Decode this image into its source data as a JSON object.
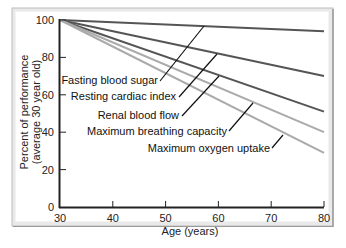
{
  "chart_data": {
    "type": "line",
    "title": "",
    "xlabel": "Age (years)",
    "ylabel": [
      "Percent of performance",
      "(average 30 year old)"
    ],
    "xlim": [
      30,
      80
    ],
    "ylim": [
      0,
      100
    ],
    "xticks": [
      30,
      40,
      50,
      60,
      70,
      80
    ],
    "yticks": [
      0,
      20,
      40,
      60,
      80,
      100
    ],
    "grid": false,
    "legend": "inline annotations with leader lines",
    "x": [
      30,
      80
    ],
    "series": [
      {
        "name": "Fasting blood sugar",
        "values": [
          100,
          94
        ],
        "color": "#555555"
      },
      {
        "name": "Resting cardiac index",
        "values": [
          100,
          70
        ],
        "color": "#555555"
      },
      {
        "name": "Renal blood flow",
        "values": [
          100,
          51
        ],
        "color": "#555555"
      },
      {
        "name": "Maximum breathing capacity",
        "values": [
          100,
          40
        ],
        "color": "#aaaaaa"
      },
      {
        "name": "Maximum oxygen uptake",
        "values": [
          100,
          29
        ],
        "color": "#aaaaaa"
      }
    ],
    "annotations": [
      {
        "text": "Fasting blood sugar",
        "label_x": 158,
        "label_y": 84,
        "leader": [
          [
            160,
            81
          ],
          [
            204,
            26
          ]
        ]
      },
      {
        "text": "Resting cardiac index",
        "label_x": 176,
        "label_y": 100,
        "leader": [
          [
            179,
            97
          ],
          [
            217,
            54
          ]
        ]
      },
      {
        "text": "Renal blood flow",
        "label_x": 179,
        "label_y": 119,
        "leader": [
          [
            182,
            116
          ],
          [
            219,
            76
          ]
        ]
      },
      {
        "text": "Maximum breathing capacity",
        "label_x": 227,
        "label_y": 135,
        "leader": [
          [
            229,
            131
          ],
          [
            253,
            103
          ]
        ]
      },
      {
        "text": "Maximum oxygen uptake",
        "label_x": 270,
        "label_y": 152,
        "leader": [
          [
            272,
            148
          ],
          [
            283,
            135
          ]
        ]
      }
    ]
  }
}
